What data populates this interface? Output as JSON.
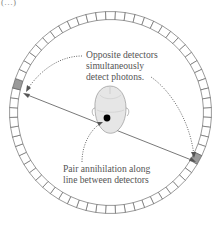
{
  "figure": {
    "corner_mark": "(…)",
    "detector_ring": {
      "segment_count": 64,
      "highlighted_detectors": [
        "left",
        "lower-right"
      ],
      "colors": {
        "segment_stroke": "#555555",
        "highlight_fill": "#9a9a9a",
        "line": "#555555",
        "annihilation_point": "#000000",
        "head_fill": "#e4e4e4"
      }
    },
    "annotations": {
      "top": {
        "lines": [
          "Opposite detectors",
          "simultaneously",
          "detect photons."
        ]
      },
      "bottom": {
        "lines": [
          "Pair annihilation along",
          "line between detectors"
        ]
      }
    }
  }
}
